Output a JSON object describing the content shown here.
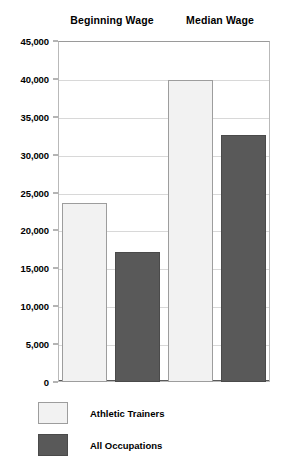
{
  "chart_data": {
    "type": "bar",
    "title": "",
    "xlabel": "",
    "ylabel": "",
    "categories": [
      "Beginning Wage",
      "Median Wage"
    ],
    "series": [
      {
        "name": "Athletic Trainers",
        "color": "#f2f2f2",
        "values": [
          23600,
          39800
        ]
      },
      {
        "name": "All Occupations",
        "color": "#595959",
        "values": [
          17100,
          32600
        ]
      }
    ],
    "ylim": [
      0,
      45000
    ],
    "ytick_values": [
      45000,
      40000,
      35000,
      30000,
      25000,
      20000,
      15000,
      10000,
      5000,
      0
    ],
    "ytick_labels": [
      "45,000",
      "40,000",
      "35,000",
      "30,000",
      "25,000",
      "20,000",
      "15,000",
      "10,000",
      "5,000",
      "0"
    ],
    "grid": true,
    "legend_position": "bottom-left"
  },
  "group_headers": [
    {
      "label": "Beginning Wage"
    },
    {
      "label": "Median Wage"
    }
  ],
  "legend": {
    "items": [
      {
        "label": "Athletic Trainers"
      },
      {
        "label": "All Occupations"
      }
    ]
  }
}
